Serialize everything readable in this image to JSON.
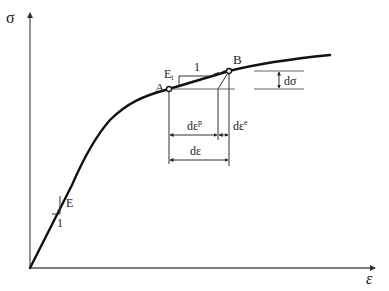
{
  "diagram": {
    "type": "stress-strain curve",
    "axes": {
      "y_label": "σ",
      "x_label": "ε"
    },
    "points": [
      {
        "id": "A",
        "label": "A"
      },
      {
        "id": "B",
        "label": "B"
      }
    ],
    "annotations": {
      "elastic_modulus": "E",
      "elastic_slope_run": "1",
      "tangent_modulus": "E",
      "tangent_modulus_sub": "t",
      "tangent_slope_run": "1",
      "stress_increment": "dσ",
      "plastic_strain_increment": "dε",
      "plastic_strain_sup": "p",
      "elastic_strain_increment": "dε",
      "elastic_strain_sup": "e",
      "total_strain_increment": "dε"
    }
  }
}
